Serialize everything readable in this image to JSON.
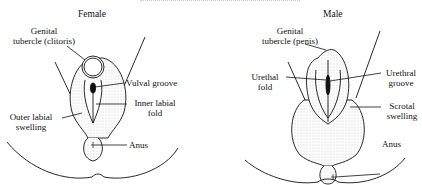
{
  "panels": {
    "female": {
      "title": "Female",
      "labels": {
        "genital_tubercle": [
          "Genital",
          "tubercle (clitoris)"
        ],
        "vulval_groove": "Vulval groove",
        "inner_labial_fold": [
          "Inner labial",
          "fold"
        ],
        "outer_labial_swelling": [
          "Outer labial",
          "swelling"
        ],
        "anus": "Anus"
      }
    },
    "male": {
      "title": "Male",
      "labels": {
        "genital_tubercle": [
          "Genital",
          "tubercle (penis)"
        ],
        "urethal_fold": [
          "Urethal",
          "fold"
        ],
        "urethral_groove": [
          "Urethral",
          "groove"
        ],
        "scrotal_swelling": [
          "Scrotal",
          "swelling"
        ],
        "anus": "Anus"
      }
    }
  },
  "colors": {
    "ink": "#111111",
    "stipple": "#bdbdbd",
    "background": "#ffffff"
  }
}
